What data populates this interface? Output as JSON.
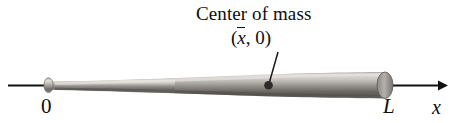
{
  "figure": {
    "kind": "physics-diagram",
    "background_color": "#ffffff",
    "ink_color": "#0d0d0d",
    "annotations": {
      "com_title": "Center of mass",
      "com_coordinate_open": "(",
      "com_coordinate_var": "x",
      "com_coordinate_rest": ", 0)"
    },
    "axis": {
      "name": "x-axis",
      "label": "x",
      "origin_label": "0",
      "end_label": "L",
      "line_color": "#111111",
      "x_start": 8,
      "x_end": 440,
      "y": 85,
      "arrow_at": "right"
    },
    "bat": {
      "name": "baseball-bat",
      "knob_x": 45,
      "tip_x": 392,
      "handle_color_light": "#d8d5d0",
      "handle_color_dark": "#6e6a66",
      "barrel_color_light": "#cfccc6",
      "barrel_color_dark": "#5e5b57"
    },
    "center_of_mass_marker": {
      "name": "center-of-mass-dot",
      "x": 268,
      "y": 85,
      "radius": 4.2,
      "color": "#2e2b29"
    },
    "leader_line": {
      "name": "leader-line",
      "from_x": 278,
      "from_y": 52,
      "to_x": 269,
      "to_y": 82,
      "color": "#1a1a1a"
    }
  }
}
